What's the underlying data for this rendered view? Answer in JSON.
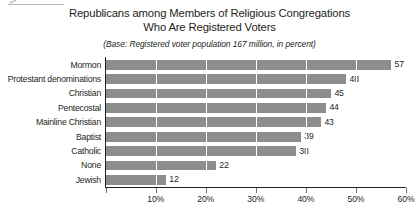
{
  "chart_data": {
    "type": "bar",
    "orientation": "horizontal",
    "title": "Republicans among Members of Religious Congregations Who Are Registered Voters",
    "title_lines": [
      "Republicans among Members of Religious Congregations",
      "Who Are Registered Voters"
    ],
    "subtitle": "(Base: Registered voter population 167 million, in percent)",
    "xlabel": "",
    "ylabel": "",
    "categories": [
      "Mormon",
      "Protestant denominations",
      "Christian",
      "Pentecostal",
      "Mainline Christian",
      "Baptist",
      "Catholic",
      "None",
      "Jewish"
    ],
    "values": [
      57,
      48,
      45,
      44,
      43,
      39,
      38,
      22,
      12
    ],
    "value_labels": [
      "57",
      "48",
      "45",
      "44",
      "43",
      "39",
      "38",
      "22",
      "12"
    ],
    "xlim": [
      0,
      60
    ],
    "xticks": [
      0,
      10,
      20,
      30,
      40,
      50,
      60
    ],
    "xtick_labels": [
      "",
      "10%",
      "20%",
      "30%",
      "40%",
      "50%",
      "60%"
    ],
    "grid": "vertical-white-over-bars",
    "legend": null,
    "colors": {
      "bar": "#8d8d8d",
      "text": "#231f20",
      "axis": "#231f20",
      "gridline": "#ffffff",
      "background": "#ffffff"
    }
  }
}
